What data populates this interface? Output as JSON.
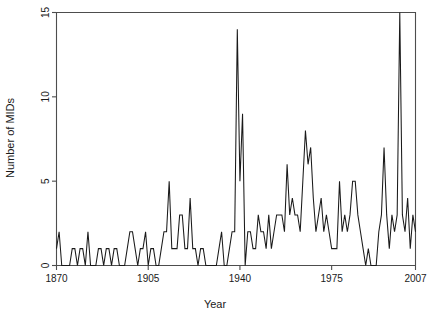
{
  "chart_data": {
    "type": "line",
    "title": "",
    "xlabel": "Year",
    "ylabel": "Number of MIDs",
    "xlim": [
      1870,
      2007
    ],
    "ylim": [
      0,
      15
    ],
    "grid": false,
    "legend": false,
    "line_color": "#1a1a1a",
    "xticks": [
      1870,
      1905,
      1940,
      1975,
      2007
    ],
    "xticklabels": [
      "1870",
      "1905",
      "1940",
      "1975",
      "2007"
    ],
    "yticks": [
      0,
      5,
      10,
      15
    ],
    "yticklabels": [
      "0",
      "5",
      "10",
      "15"
    ],
    "x": [
      1870,
      1871,
      1872,
      1873,
      1874,
      1875,
      1876,
      1877,
      1878,
      1879,
      1880,
      1881,
      1882,
      1883,
      1884,
      1885,
      1886,
      1887,
      1888,
      1889,
      1890,
      1891,
      1892,
      1893,
      1894,
      1895,
      1896,
      1897,
      1898,
      1899,
      1900,
      1901,
      1902,
      1903,
      1904,
      1905,
      1906,
      1907,
      1908,
      1909,
      1910,
      1911,
      1912,
      1913,
      1914,
      1915,
      1916,
      1917,
      1918,
      1919,
      1920,
      1921,
      1922,
      1923,
      1924,
      1925,
      1926,
      1927,
      1928,
      1929,
      1930,
      1931,
      1932,
      1933,
      1934,
      1935,
      1936,
      1937,
      1938,
      1939,
      1940,
      1941,
      1942,
      1943,
      1944,
      1945,
      1946,
      1947,
      1948,
      1949,
      1950,
      1951,
      1952,
      1953,
      1954,
      1955,
      1956,
      1957,
      1958,
      1959,
      1960,
      1961,
      1962,
      1963,
      1964,
      1965,
      1966,
      1967,
      1968,
      1969,
      1970,
      1971,
      1972,
      1973,
      1974,
      1975,
      1976,
      1977,
      1978,
      1979,
      1980,
      1981,
      1982,
      1983,
      1984,
      1985,
      1986,
      1987,
      1988,
      1989,
      1990,
      1991,
      1992,
      1993,
      1994,
      1995,
      1996,
      1997,
      1998,
      1999,
      2000,
      2001,
      2002,
      2003,
      2004,
      2005,
      2006,
      2007
    ],
    "values": [
      1,
      2,
      0,
      0,
      0,
      0,
      1,
      1,
      0,
      1,
      1,
      0,
      2,
      0,
      0,
      0,
      1,
      1,
      0,
      1,
      1,
      0,
      1,
      1,
      0,
      0,
      0,
      1,
      2,
      2,
      1,
      0,
      1,
      1,
      2,
      0,
      1,
      1,
      0,
      0,
      1,
      2,
      2,
      5,
      1,
      1,
      1,
      3,
      3,
      1,
      1,
      4,
      1,
      1,
      0,
      1,
      1,
      0,
      0,
      0,
      0,
      0,
      1,
      2,
      0,
      0,
      1,
      2,
      2,
      14,
      5,
      9,
      0,
      2,
      2,
      1,
      1,
      3,
      2,
      2,
      1,
      3,
      1,
      2,
      3,
      3,
      3,
      2,
      6,
      3,
      4,
      3,
      3,
      2,
      5,
      8,
      6,
      7,
      4,
      2,
      3,
      4,
      2,
      3,
      2,
      1,
      1,
      1,
      5,
      2,
      3,
      2,
      3,
      5,
      5,
      3,
      2,
      1,
      0,
      1,
      0,
      0,
      0,
      2,
      3,
      7,
      3,
      1,
      3,
      2,
      3,
      15,
      3,
      2,
      4,
      1,
      3,
      2
    ]
  },
  "labels": {
    "xlabel": "Year",
    "ylabel": "Number of MIDs"
  }
}
